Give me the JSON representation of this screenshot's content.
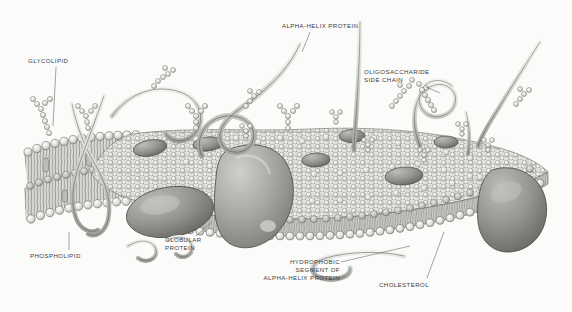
{
  "figure": {
    "style": "grayscale pen-and-ink scientific illustration",
    "background_color": "#fbfbfa",
    "ink_color": "#3d3d3d",
    "fill_light": "#e9e9e7",
    "fill_mid": "#b9b9b6",
    "fill_dark": "#8d8d8a"
  },
  "labels": {
    "glycolipid": "GLYCOLIPID",
    "alpha_helix_protein": "ALPHA-HELIX PROTEIN",
    "oligosaccharide_line1": "OLIGOSACCHARIDE",
    "oligosaccharide_line2": "SIDE CHAIN",
    "phospholipid": "PHOSPHOLIPID",
    "globular_line1": "GLOBULAR",
    "globular_line2": "PROTEIN",
    "hydrophobic_line1": "HYDROPHOBIC",
    "hydrophobic_line2": "SEGMENT OF",
    "hydrophobic_line3": "ALPHA-HELIX PROTEIN",
    "cholesterol": "CHOLESTEROL"
  },
  "structures": {
    "bilayer": "phospholipid bilayer with spherical head groups and wavy hydrophobic tails",
    "globular_proteins": "large shaded ovoid proteins embedded in and spanning the bilayer",
    "alpha_helices": "ribbon-like looping helices crossing the membrane",
    "sugar_chains": "beaded branched oligosaccharide side chains on the outer surface"
  }
}
